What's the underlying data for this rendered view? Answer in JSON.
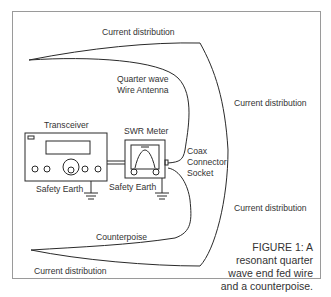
{
  "figure": {
    "labels": {
      "current_top": "Current distribution",
      "current_right_upper": "Current distribution",
      "current_right_lower": "Current distribution",
      "current_bottom": "Current distribution",
      "antenna_line1": "Quarter wave",
      "antenna_line2": "Wire Antenna",
      "transceiver": "Transceiver",
      "swr_meter": "SWR Meter",
      "coax_line1": "Coax",
      "coax_line2": "Connector",
      "coax_line3": "Socket",
      "safety_earth_1": "Safety Earth",
      "safety_earth_2": "Safety Earth",
      "counterpoise": "Counterpoise"
    },
    "caption": {
      "line1": "FIGURE 1: A",
      "line2": "resonant quarter",
      "line3": "wave end fed wire",
      "line4": "and a counterpoise."
    },
    "colors": {
      "line": "#2a2a2a",
      "frame": "#9a9a9a",
      "background": "#ffffff"
    }
  }
}
